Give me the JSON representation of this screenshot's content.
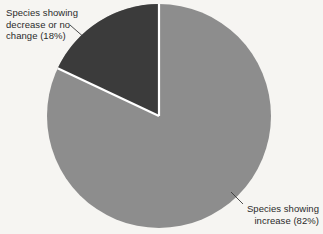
{
  "chart_data": {
    "type": "pie",
    "title": "",
    "categories": [
      "Species showing decrease or no change",
      "Species showing increase"
    ],
    "values": [
      18,
      82
    ],
    "value_unit": "%",
    "slice_colors": [
      "#3b3b3b",
      "#8d8d8d"
    ],
    "separator_color": "#ffffff",
    "background_color": "#f6f5f2",
    "legend": "none",
    "grid": false,
    "labels_position": "outside-with-leader-lines",
    "start_angle_deg": 0,
    "direction": "counterclockwise"
  },
  "labels": {
    "dark_slice": {
      "line1": "Species showing",
      "line2": "decrease or no",
      "line3": "change (18%)",
      "value": 18,
      "color": "#3b3b3b"
    },
    "light_slice": {
      "line1": "Species showing",
      "line2": "increase (82%)",
      "value": 82,
      "color": "#8d8d8d"
    }
  },
  "geometry": {
    "center_x": 159,
    "center_y": 116,
    "radius": 112
  }
}
